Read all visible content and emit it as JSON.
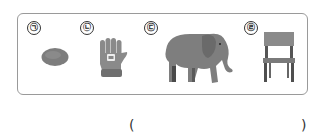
{
  "items": [
    {
      "label": "㉠",
      "name": "stone"
    },
    {
      "label": "㉡",
      "name": "glove"
    },
    {
      "label": "㉢",
      "name": "elephant"
    },
    {
      "label": "㉣",
      "name": "chair"
    }
  ],
  "answer": {
    "open": "(",
    "close": ")",
    "value": ""
  },
  "colors": {
    "border": "#9a9a9a",
    "object_gray": "#7a7a7a",
    "dark_gray": "#555555"
  }
}
